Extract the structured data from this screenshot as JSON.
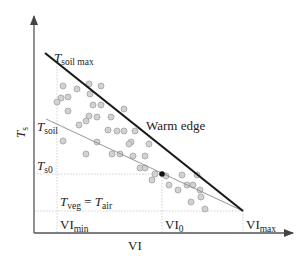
{
  "diagram": {
    "axes": {
      "y_label": "Ts",
      "y_label_main": "T",
      "y_label_sub": "s",
      "x_label": "VI"
    },
    "labels": {
      "tsoil_max_main": "T",
      "tsoil_max_sub": "soil max",
      "tsoil_main": "T",
      "tsoil_sub": "soil",
      "ts0_main": "T",
      "ts0_sub": "s0",
      "tveg_main": "T",
      "tveg_sub": "veg",
      "equals": " = ",
      "tair_main": "T",
      "tair_sub": "air",
      "warm_edge": "Warm edge",
      "vimin_main": "VI",
      "vimin_sub": "min",
      "vi0_main": "VI",
      "vi0_sub": "0",
      "vimax_main": "VI",
      "vimax_sub": "max"
    },
    "colors": {
      "axis": "#555555",
      "warm_edge": "#1a1a1a",
      "thin_line": "#888888",
      "guide": "#bbbbbb",
      "points_fill": "#cfcfcf",
      "points_stroke": "#9a9a9a",
      "highlight_point": "#111111"
    }
  }
}
